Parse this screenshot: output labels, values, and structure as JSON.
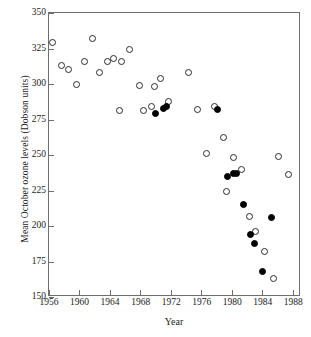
{
  "chart_data": {
    "type": "scatter",
    "title": "",
    "xlabel": "Year",
    "ylabel": "Mean October ozone levels (Dobson units)",
    "xlim": [
      1956,
      1989
    ],
    "ylim": [
      150,
      350
    ],
    "xticks": [
      1956,
      1960,
      1964,
      1968,
      1972,
      1976,
      1980,
      1984,
      1988
    ],
    "yticks": [
      150,
      175,
      200,
      225,
      250,
      275,
      300,
      325,
      350
    ],
    "grid": false,
    "legend": null,
    "series": [
      {
        "name": "open-circle-measurements",
        "marker": "open circle",
        "color": "#ffffff",
        "edge_color": "#2b2b2b",
        "points": [
          {
            "x": 1956.4,
            "y": 329
          },
          {
            "x": 1957.7,
            "y": 313
          },
          {
            "x": 1958.6,
            "y": 310
          },
          {
            "x": 1959.6,
            "y": 300
          },
          {
            "x": 1960.6,
            "y": 316
          },
          {
            "x": 1961.7,
            "y": 332
          },
          {
            "x": 1962.6,
            "y": 308
          },
          {
            "x": 1963.6,
            "y": 316
          },
          {
            "x": 1964.5,
            "y": 318
          },
          {
            "x": 1965.5,
            "y": 316
          },
          {
            "x": 1965.2,
            "y": 281
          },
          {
            "x": 1966.6,
            "y": 324
          },
          {
            "x": 1967.8,
            "y": 299
          },
          {
            "x": 1968.4,
            "y": 281
          },
          {
            "x": 1969.4,
            "y": 284
          },
          {
            "x": 1969.8,
            "y": 298
          },
          {
            "x": 1970.6,
            "y": 304
          },
          {
            "x": 1971.6,
            "y": 288
          },
          {
            "x": 1974.3,
            "y": 308
          },
          {
            "x": 1975.5,
            "y": 282
          },
          {
            "x": 1976.6,
            "y": 251
          },
          {
            "x": 1977.7,
            "y": 284
          },
          {
            "x": 1978.8,
            "y": 262
          },
          {
            "x": 1979.3,
            "y": 224
          },
          {
            "x": 1980.2,
            "y": 248
          },
          {
            "x": 1981.2,
            "y": 240
          },
          {
            "x": 1982.3,
            "y": 207
          },
          {
            "x": 1983.1,
            "y": 196
          },
          {
            "x": 1984.2,
            "y": 182
          },
          {
            "x": 1985.4,
            "y": 163
          },
          {
            "x": 1986.0,
            "y": 249
          },
          {
            "x": 1987.3,
            "y": 236
          }
        ]
      },
      {
        "name": "filled-circle-measurements",
        "marker": "filled circle",
        "color": "#000000",
        "edge_color": "#000000",
        "points": [
          {
            "x": 1970.0,
            "y": 279
          },
          {
            "x": 1971.0,
            "y": 283
          },
          {
            "x": 1971.4,
            "y": 284
          },
          {
            "x": 1978.1,
            "y": 282
          },
          {
            "x": 1979.4,
            "y": 235
          },
          {
            "x": 1980.2,
            "y": 237
          },
          {
            "x": 1980.6,
            "y": 237
          },
          {
            "x": 1981.5,
            "y": 215
          },
          {
            "x": 1982.4,
            "y": 194
          },
          {
            "x": 1982.9,
            "y": 188
          },
          {
            "x": 1984.0,
            "y": 168
          },
          {
            "x": 1985.1,
            "y": 206
          }
        ]
      }
    ]
  },
  "axes": {
    "x_title": "Year",
    "y_title": "Mean October ozone levels (Dobson units)",
    "x_tick_labels": [
      "1956",
      "1960",
      "1964",
      "1968",
      "1972",
      "1976",
      "1980",
      "1984",
      "1988"
    ],
    "y_tick_labels": [
      "150",
      "175",
      "200",
      "225",
      "250",
      "275",
      "300",
      "325",
      "350"
    ]
  },
  "style": {
    "frame_color": "#6e6e6e",
    "text_color": "#1a1a1a",
    "background": "#ffffff",
    "open_marker_fill": "#ffffff",
    "filled_marker_fill": "#000000"
  }
}
